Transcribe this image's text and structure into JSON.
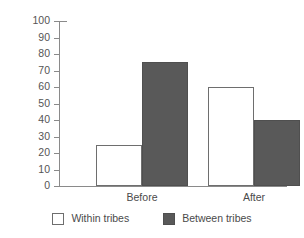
{
  "chart_data": {
    "type": "bar",
    "title": "",
    "xlabel": "",
    "ylabel": "",
    "categories": [
      "Before",
      "After"
    ],
    "series": [
      {
        "name": "Within tribes",
        "values": [
          25,
          60
        ],
        "color": "#ffffff"
      },
      {
        "name": "Between tribes",
        "values": [
          75,
          40
        ],
        "color": "#595959"
      }
    ],
    "ylim": [
      0,
      100
    ],
    "yticks": [
      0,
      10,
      20,
      30,
      40,
      50,
      60,
      70,
      80,
      90,
      100
    ],
    "ytick_labels": [
      "0",
      "10",
      "20",
      "30",
      "40",
      "50",
      "60",
      "70",
      "80",
      "90",
      "100"
    ],
    "grid": false,
    "legend_position": "bottom"
  },
  "axis": {
    "y_ticks": [
      {
        "value": 100,
        "label": "100"
      },
      {
        "value": 90,
        "label": "90"
      },
      {
        "value": 80,
        "label": "80"
      },
      {
        "value": 70,
        "label": "70"
      },
      {
        "value": 60,
        "label": "60"
      },
      {
        "value": 50,
        "label": "50"
      },
      {
        "value": 40,
        "label": "40"
      },
      {
        "value": 30,
        "label": "30"
      },
      {
        "value": 20,
        "label": "20"
      },
      {
        "value": 10,
        "label": "10"
      },
      {
        "value": 0,
        "label": "0"
      }
    ]
  },
  "groups": [
    {
      "label": "Before",
      "bars": [
        {
          "series": "Within tribes",
          "value": 25,
          "style": "light"
        },
        {
          "series": "Between tribes",
          "value": 75,
          "style": "dark"
        }
      ]
    },
    {
      "label": "After",
      "bars": [
        {
          "series": "Within tribes",
          "value": 60,
          "style": "light"
        },
        {
          "series": "Between tribes",
          "value": 40,
          "style": "dark"
        }
      ]
    }
  ],
  "legend": {
    "items": [
      {
        "label": "Within tribes",
        "style": "light"
      },
      {
        "label": "Between tribes",
        "style": "dark"
      }
    ]
  },
  "colors": {
    "dark_bar": "#595959",
    "light_bar": "#ffffff",
    "axis": "#8a8a8a",
    "text": "#4a4a4a"
  }
}
